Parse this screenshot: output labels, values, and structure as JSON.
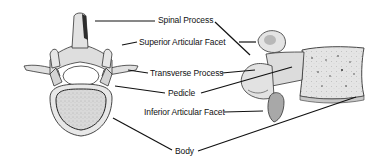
{
  "diagram": {
    "views": [
      "superior-view",
      "lateral-view"
    ],
    "colors": {
      "background": "#ffffff",
      "bone_fill": "#e2e2e2",
      "bone_shade": "#9a9a9a",
      "outline": "#2a2a2a",
      "leader_line": "#111111",
      "text": "#111111"
    },
    "labels": [
      {
        "id": "spinal-process",
        "text": "Spinal Process"
      },
      {
        "id": "superior-articular-facet",
        "text": "Superior Articular Facet"
      },
      {
        "id": "transverse-process",
        "text": "Transverse Process"
      },
      {
        "id": "pedicle",
        "text": "Pedicle"
      },
      {
        "id": "inferior-articular-facet",
        "text": "Inferior Articular Facet"
      },
      {
        "id": "body",
        "text": "Body"
      }
    ]
  }
}
